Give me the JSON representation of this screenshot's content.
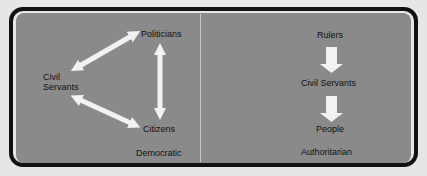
{
  "democratic": {
    "nodes": {
      "politicians": "Politicians",
      "civil_servants_line1": "Civil",
      "civil_servants_line2": "Servants",
      "citizens": "Citizens"
    },
    "caption": "Democratic",
    "arrows": [
      {
        "from": "Politicians",
        "to": "Civil Servants",
        "type": "double-headed"
      },
      {
        "from": "Politicians",
        "to": "Citizens",
        "type": "double-headed"
      },
      {
        "from": "Civil Servants",
        "to": "Citizens",
        "type": "double-headed"
      }
    ]
  },
  "authoritarian": {
    "nodes": {
      "rulers": "Rulers",
      "civil_servants": "Civil Servants",
      "people": "People"
    },
    "caption": "Authoritarian",
    "arrows": [
      {
        "from": "Rulers",
        "to": "Civil Servants",
        "type": "downward"
      },
      {
        "from": "Civil Servants",
        "to": "People",
        "type": "downward"
      }
    ]
  },
  "colors": {
    "panel": "#8a8a8a",
    "frame": "#111111",
    "arrow": "#f2f2f2"
  }
}
